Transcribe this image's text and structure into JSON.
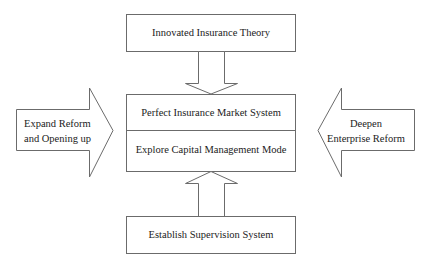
{
  "diagram": {
    "type": "flow-diagram",
    "colors": {
      "stroke": "#6b6b6b",
      "fill": "#ffffff",
      "text": "#222222",
      "background": "#ffffff"
    },
    "top_box": {
      "label": "Innovated Insurance Theory"
    },
    "center_box": {
      "upper_label": "Perfect Insurance Market System",
      "lower_label": "Explore Capital Management Mode"
    },
    "bottom_box": {
      "label": "Establish Supervision System"
    },
    "left_arrow": {
      "direction": "right",
      "line1": "Expand Reform",
      "line2": "and Opening up"
    },
    "right_arrow": {
      "direction": "left",
      "line1": "Deepen",
      "line2": "Enterprise Reform"
    },
    "top_arrow": {
      "direction": "down"
    },
    "bottom_arrow": {
      "direction": "up"
    }
  }
}
